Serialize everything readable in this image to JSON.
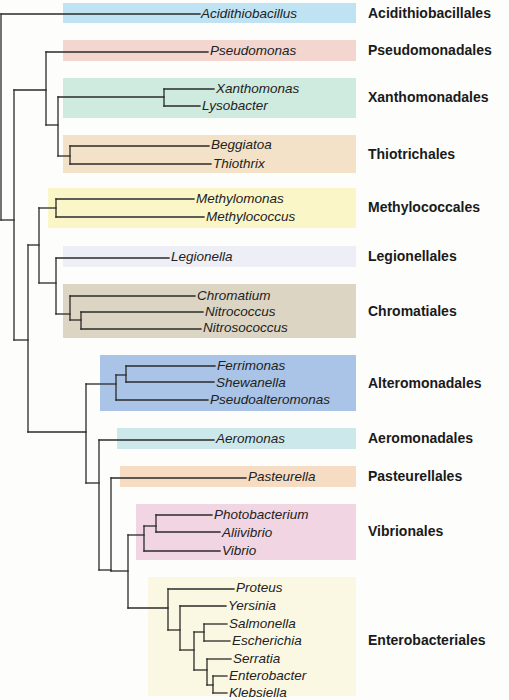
{
  "line_color": "#2a2a2a",
  "orders": [
    {
      "name": "Acidithiobacillales",
      "label_y": 13,
      "band": {
        "x": 63,
        "y": 3,
        "w": 293,
        "h": 20,
        "color": "#bfe3f2"
      }
    },
    {
      "name": "Pseudomonadales",
      "label_y": 50,
      "band": {
        "x": 63,
        "y": 40,
        "w": 293,
        "h": 21,
        "color": "#f3d6cf"
      }
    },
    {
      "name": "Xanthomonadales",
      "label_y": 97,
      "band": {
        "x": 63,
        "y": 78,
        "w": 293,
        "h": 40,
        "color": "#cfeade"
      }
    },
    {
      "name": "Thiotrichales",
      "label_y": 154,
      "band": {
        "x": 63,
        "y": 135,
        "w": 293,
        "h": 38,
        "color": "#f3e2c8"
      }
    },
    {
      "name": "Methylococcales",
      "label_y": 207,
      "band": {
        "x": 48,
        "y": 188,
        "w": 308,
        "h": 40,
        "color": "#faf6c8"
      }
    },
    {
      "name": "Legionellales",
      "label_y": 256,
      "band": {
        "x": 63,
        "y": 246,
        "w": 293,
        "h": 21,
        "color": "#eeeef6"
      }
    },
    {
      "name": "Chromatiales",
      "label_y": 311,
      "band": {
        "x": 63,
        "y": 284,
        "w": 293,
        "h": 54,
        "color": "#dcd5c4"
      }
    },
    {
      "name": "Alteromonadales",
      "label_y": 383,
      "band": {
        "x": 100,
        "y": 355,
        "w": 256,
        "h": 56,
        "color": "#a9c4e6"
      }
    },
    {
      "name": "Aeromonadales",
      "label_y": 438,
      "band": {
        "x": 117,
        "y": 428,
        "w": 239,
        "h": 21,
        "color": "#cde8ea"
      }
    },
    {
      "name": "Pasteurellales",
      "label_y": 476,
      "band": {
        "x": 120,
        "y": 466,
        "w": 236,
        "h": 21,
        "color": "#f6dcc3"
      }
    },
    {
      "name": "Vibrionales",
      "label_y": 531,
      "band": {
        "x": 136,
        "y": 504,
        "w": 220,
        "h": 56,
        "color": "#f2d5e2"
      }
    },
    {
      "name": "Enterobacteriales",
      "label_y": 640,
      "band": {
        "x": 148,
        "y": 577,
        "w": 208,
        "h": 119,
        "color": "#faf7e2"
      }
    }
  ],
  "taxa": [
    {
      "name": "Acidithiobacillus",
      "x": 201,
      "y": 14
    },
    {
      "name": "Pseudomonas",
      "x": 210,
      "y": 51
    },
    {
      "name": "Xanthomonas",
      "x": 216,
      "y": 89
    },
    {
      "name": "Lysobacter",
      "x": 202,
      "y": 106
    },
    {
      "name": "Beggiatoa",
      "x": 211,
      "y": 145
    },
    {
      "name": "Thiothrix",
      "x": 213,
      "y": 164
    },
    {
      "name": "Methylomonas",
      "x": 196,
      "y": 199
    },
    {
      "name": "Methylococcus",
      "x": 206,
      "y": 217
    },
    {
      "name": "Legionella",
      "x": 171,
      "y": 257
    },
    {
      "name": "Chromatium",
      "x": 197,
      "y": 296
    },
    {
      "name": "Nitrococcus",
      "x": 205,
      "y": 312
    },
    {
      "name": "Nitrosococcus",
      "x": 203,
      "y": 328
    },
    {
      "name": "Ferrimonas",
      "x": 217,
      "y": 366
    },
    {
      "name": "Shewanella",
      "x": 216,
      "y": 383
    },
    {
      "name": "Pseudoalteromonas",
      "x": 210,
      "y": 400
    },
    {
      "name": "Aeromonas",
      "x": 216,
      "y": 439
    },
    {
      "name": "Pasteurella",
      "x": 248,
      "y": 477
    },
    {
      "name": "Photobacterium",
      "x": 214,
      "y": 515
    },
    {
      "name": "Aliivibrio",
      "x": 222,
      "y": 533
    },
    {
      "name": "Vibrio",
      "x": 222,
      "y": 551
    },
    {
      "name": "Proteus",
      "x": 236,
      "y": 588
    },
    {
      "name": "Yersinia",
      "x": 228,
      "y": 606
    },
    {
      "name": "Salmonella",
      "x": 229,
      "y": 624
    },
    {
      "name": "Escherichia",
      "x": 232,
      "y": 641
    },
    {
      "name": "Serratia",
      "x": 233,
      "y": 659
    },
    {
      "name": "Enterobacter",
      "x": 229,
      "y": 676
    },
    {
      "name": "Klebsiella",
      "x": 229,
      "y": 693
    }
  ],
  "edges": [
    [
      1,
      14,
      1,
      220
    ],
    [
      1,
      14,
      200,
      14
    ],
    [
      1,
      220,
      14,
      220
    ],
    [
      14,
      90,
      14,
      340
    ],
    [
      14,
      90,
      46,
      90
    ],
    [
      14,
      340,
      28,
      340
    ],
    [
      46,
      52,
      46,
      125
    ],
    [
      46,
      52,
      208,
      52
    ],
    [
      46,
      125,
      58,
      125
    ],
    [
      58,
      97,
      58,
      156
    ],
    [
      58,
      97,
      164,
      97
    ],
    [
      58,
      156,
      70,
      156
    ],
    [
      164,
      89,
      164,
      106
    ],
    [
      164,
      89,
      214,
      89
    ],
    [
      164,
      106,
      200,
      106
    ],
    [
      70,
      146,
      70,
      164
    ],
    [
      70,
      146,
      209,
      146
    ],
    [
      70,
      164,
      211,
      164
    ],
    [
      28,
      245,
      28,
      432
    ],
    [
      28,
      245,
      39,
      245
    ],
    [
      28,
      432,
      86,
      432
    ],
    [
      39,
      208,
      39,
      283
    ],
    [
      39,
      208,
      56,
      208
    ],
    [
      39,
      283,
      56,
      283
    ],
    [
      56,
      199,
      56,
      217
    ],
    [
      56,
      199,
      194,
      199
    ],
    [
      56,
      217,
      204,
      217
    ],
    [
      56,
      258,
      56,
      314
    ],
    [
      56,
      258,
      169,
      258
    ],
    [
      56,
      314,
      70,
      314
    ],
    [
      70,
      296,
      70,
      320
    ],
    [
      70,
      296,
      195,
      296
    ],
    [
      70,
      320,
      81,
      320
    ],
    [
      81,
      312,
      81,
      329
    ],
    [
      81,
      312,
      203,
      312
    ],
    [
      81,
      329,
      201,
      329
    ],
    [
      86,
      384,
      86,
      483
    ],
    [
      86,
      384,
      116,
      384
    ],
    [
      86,
      483,
      99,
      483
    ],
    [
      116,
      375,
      116,
      400
    ],
    [
      116,
      375,
      126,
      375
    ],
    [
      116,
      400,
      208,
      400
    ],
    [
      126,
      366,
      126,
      382
    ],
    [
      126,
      366,
      215,
      366
    ],
    [
      126,
      382,
      214,
      382
    ],
    [
      99,
      440,
      99,
      570
    ],
    [
      99,
      440,
      214,
      440
    ],
    [
      99,
      570,
      111,
      570
    ],
    [
      111,
      478,
      111,
      571
    ],
    [
      111,
      478,
      246,
      478
    ],
    [
      111,
      571,
      128,
      571
    ],
    [
      128,
      535,
      128,
      608
    ],
    [
      128,
      535,
      144,
      535
    ],
    [
      128,
      608,
      168,
      608
    ],
    [
      144,
      526,
      144,
      551
    ],
    [
      144,
      526,
      156,
      526
    ],
    [
      144,
      551,
      220,
      551
    ],
    [
      156,
      515,
      156,
      532
    ],
    [
      156,
      515,
      212,
      515
    ],
    [
      156,
      532,
      220,
      532
    ],
    [
      168,
      589,
      168,
      630
    ],
    [
      168,
      589,
      234,
      589
    ],
    [
      168,
      630,
      180,
      630
    ],
    [
      180,
      606,
      180,
      650
    ],
    [
      180,
      606,
      226,
      606
    ],
    [
      180,
      650,
      194,
      650
    ],
    [
      194,
      632,
      194,
      670
    ],
    [
      194,
      632,
      204,
      632
    ],
    [
      194,
      670,
      207,
      670
    ],
    [
      204,
      624,
      204,
      641
    ],
    [
      204,
      624,
      227,
      624
    ],
    [
      204,
      641,
      230,
      641
    ],
    [
      207,
      659,
      207,
      685
    ],
    [
      207,
      659,
      231,
      659
    ],
    [
      207,
      685,
      213,
      685
    ],
    [
      213,
      676,
      213,
      693
    ],
    [
      213,
      676,
      227,
      676
    ],
    [
      213,
      693,
      227,
      693
    ]
  ]
}
